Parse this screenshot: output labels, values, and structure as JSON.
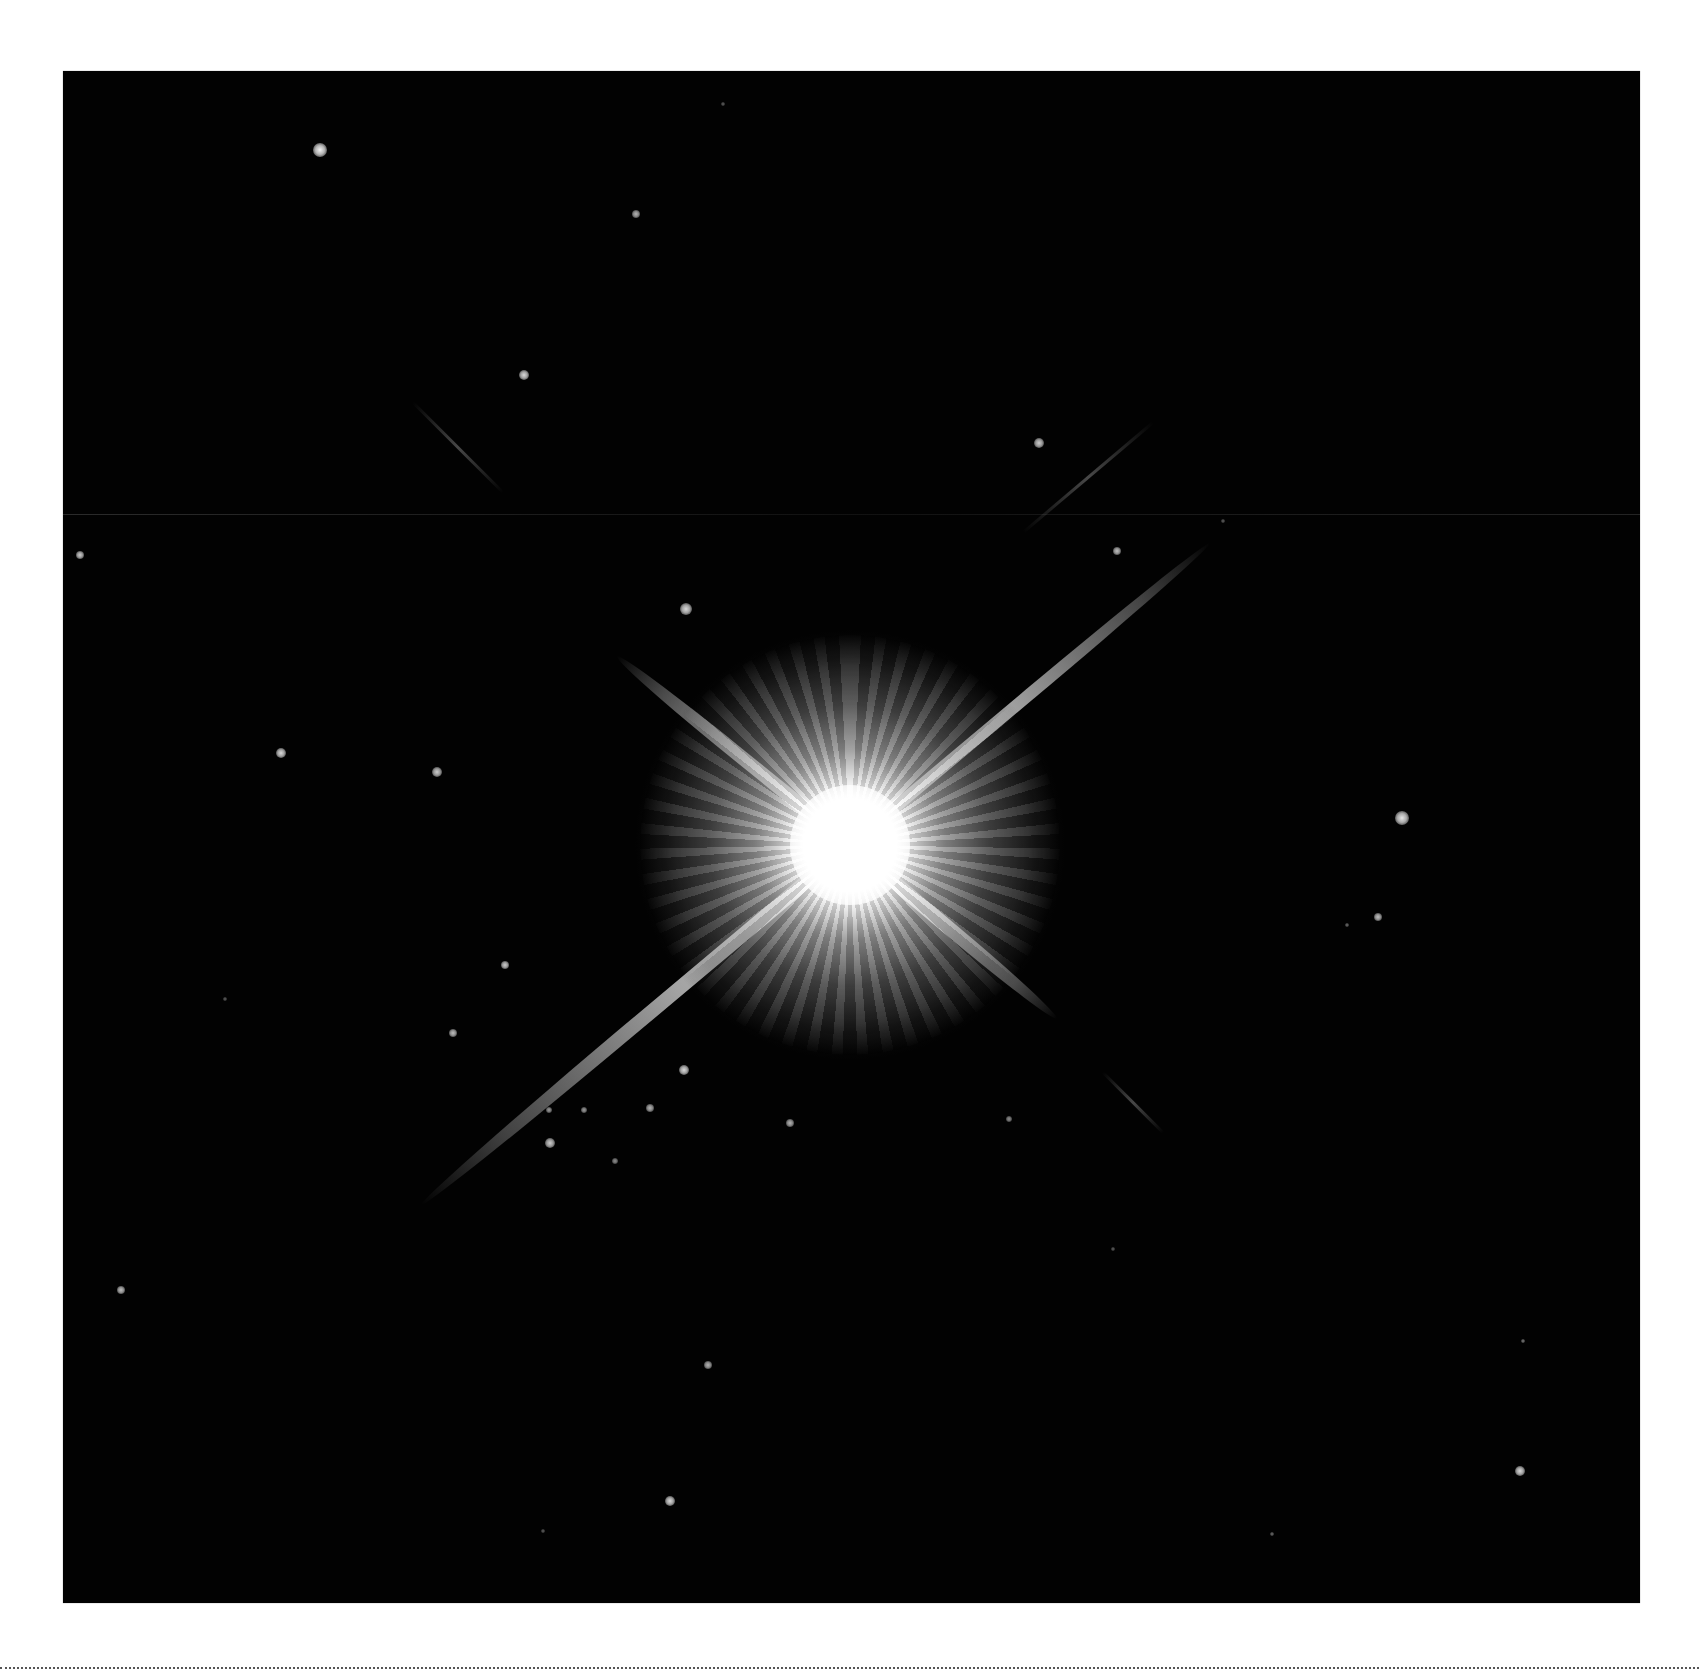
{
  "image": {
    "subject": "bright star with four diffraction spikes in a dark star field",
    "background_color": "#020202",
    "page_background": "#ffffff",
    "frame": {
      "left": 63,
      "top": 71,
      "width": 1577,
      "height": 1532
    }
  },
  "main_star": {
    "x": 787,
    "y": 774,
    "core_color": "#ffffff",
    "spikes": [
      {
        "angle": -40,
        "length": 470,
        "width": 12,
        "opacity": 0.85
      },
      {
        "angle": 140,
        "length": 560,
        "width": 14,
        "opacity": 0.8
      },
      {
        "angle": 219,
        "length": 300,
        "width": 14,
        "opacity": 0.9
      },
      {
        "angle": 40,
        "length": 270,
        "width": 14,
        "opacity": 0.9
      }
    ],
    "faint_spike_extensions": [
      {
        "x1": 350,
        "y1": 330,
        "x2": 440,
        "y2": 420
      },
      {
        "x1": 1090,
        "y1": 350,
        "x2": 960,
        "y2": 460
      },
      {
        "x1": 1040,
        "y1": 1000,
        "x2": 1100,
        "y2": 1060
      }
    ]
  },
  "stars": [
    {
      "x": 257,
      "y": 79,
      "r": 7,
      "b": 0.95
    },
    {
      "x": 573,
      "y": 143,
      "r": 4,
      "b": 0.7
    },
    {
      "x": 461,
      "y": 304,
      "r": 5,
      "b": 0.85
    },
    {
      "x": 976,
      "y": 372,
      "r": 5,
      "b": 0.8
    },
    {
      "x": 17,
      "y": 484,
      "r": 4,
      "b": 0.8
    },
    {
      "x": 623,
      "y": 538,
      "r": 6,
      "b": 0.85
    },
    {
      "x": 1054,
      "y": 480,
      "r": 4,
      "b": 0.75
    },
    {
      "x": 218,
      "y": 682,
      "r": 5,
      "b": 0.85
    },
    {
      "x": 374,
      "y": 701,
      "r": 5,
      "b": 0.8
    },
    {
      "x": 1339,
      "y": 747,
      "r": 7,
      "b": 0.9
    },
    {
      "x": 1315,
      "y": 846,
      "r": 4,
      "b": 0.75
    },
    {
      "x": 442,
      "y": 894,
      "r": 4,
      "b": 0.8
    },
    {
      "x": 390,
      "y": 962,
      "r": 4,
      "b": 0.75
    },
    {
      "x": 621,
      "y": 999,
      "r": 5,
      "b": 0.85
    },
    {
      "x": 486,
      "y": 1039,
      "r": 3,
      "b": 0.6
    },
    {
      "x": 521,
      "y": 1039,
      "r": 3,
      "b": 0.6
    },
    {
      "x": 587,
      "y": 1037,
      "r": 4,
      "b": 0.7
    },
    {
      "x": 727,
      "y": 1052,
      "r": 4,
      "b": 0.7
    },
    {
      "x": 487,
      "y": 1072,
      "r": 5,
      "b": 0.8
    },
    {
      "x": 552,
      "y": 1090,
      "r": 3,
      "b": 0.55
    },
    {
      "x": 946,
      "y": 1048,
      "r": 3,
      "b": 0.55
    },
    {
      "x": 58,
      "y": 1219,
      "r": 4,
      "b": 0.75
    },
    {
      "x": 645,
      "y": 1294,
      "r": 4,
      "b": 0.7
    },
    {
      "x": 1457,
      "y": 1400,
      "r": 5,
      "b": 0.85
    },
    {
      "x": 607,
      "y": 1430,
      "r": 5,
      "b": 0.85
    },
    {
      "x": 1284,
      "y": 854,
      "r": 2,
      "b": 0.4
    },
    {
      "x": 1460,
      "y": 1270,
      "r": 2,
      "b": 0.45
    },
    {
      "x": 1209,
      "y": 1463,
      "r": 2,
      "b": 0.4
    },
    {
      "x": 162,
      "y": 928,
      "r": 2,
      "b": 0.35
    },
    {
      "x": 1050,
      "y": 1178,
      "r": 2,
      "b": 0.35
    },
    {
      "x": 660,
      "y": 33,
      "r": 2,
      "b": 0.35
    },
    {
      "x": 1160,
      "y": 450,
      "r": 2,
      "b": 0.35
    },
    {
      "x": 1300,
      "y": 1550,
      "r": 1,
      "b": 0.3
    },
    {
      "x": 480,
      "y": 1460,
      "r": 2,
      "b": 0.35
    }
  ],
  "seams": [
    {
      "y": 443
    },
    {
      "y": 1534
    }
  ],
  "footer": {
    "divider_style": "dotted",
    "divider_y": 1668,
    "divider_color": "#555555"
  }
}
